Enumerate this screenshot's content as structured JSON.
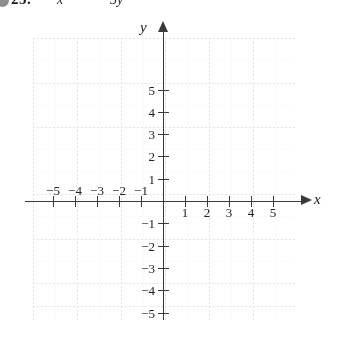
{
  "problem": {
    "bullet": "bullet-marker",
    "number": "25.",
    "equation_left": "x",
    "equation_right": "5y"
  },
  "graph": {
    "x_axis_name": "x",
    "y_axis_name": "y",
    "x_tick_labels": [
      "−5",
      "−4",
      "−3",
      "−2",
      "−1",
      "1",
      "2",
      "3",
      "4",
      "5"
    ],
    "y_tick_labels": [
      "5",
      "4",
      "3",
      "2",
      "1",
      "−1",
      "−2",
      "−3",
      "−4",
      "−5"
    ]
  },
  "chart_data": {
    "type": "scatter",
    "title": "",
    "xlabel": "x",
    "ylabel": "y",
    "xlim": [
      -6,
      6
    ],
    "ylim": [
      -6,
      6
    ],
    "xticks": [
      -5,
      -4,
      -3,
      -2,
      -1,
      1,
      2,
      3,
      4,
      5
    ],
    "yticks": [
      5,
      4,
      3,
      2,
      1,
      -1,
      -2,
      -3,
      -4,
      -5
    ],
    "grid": true,
    "legend": "none",
    "series": [],
    "x": [],
    "y": [],
    "annotations": [],
    "note": "Empty Cartesian coordinate plane provided for plotting; no data points are drawn."
  },
  "colors": {
    "background": "#ffffff",
    "axis": "#3a3a3a",
    "grid": "#d6d6d6",
    "text": "#1a1a1a",
    "bullet": "#8e8e8e"
  }
}
